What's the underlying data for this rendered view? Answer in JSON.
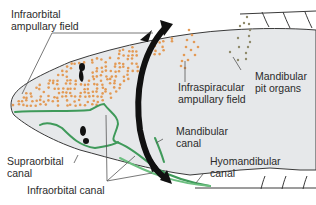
{
  "figure": {
    "colors": {
      "head_fill": "#e6e8ea",
      "outline": "#3a3a3a",
      "ampullae_dots": "#e39a55",
      "pit_organs": "#8f8a6a",
      "canal_green": "#3f9a5a",
      "arrow_black": "#111111",
      "leader_line": "#555555"
    }
  },
  "labels": {
    "infraorbital_ampullary_field": {
      "line1": "Infraorbital",
      "line2": "ampullary field"
    },
    "infraspiracular_ampullary_field": {
      "line1": "Infraspiracular",
      "line2": "ampullary field"
    },
    "mandibular_pit_organs": {
      "line1": "Mandibular",
      "line2": "pit organs"
    },
    "mandibular_canal": {
      "line1": "Mandibular",
      "line2": "canal"
    },
    "hyomandibular_canal": {
      "line1": "Hyomandibular",
      "line2": "canal"
    },
    "supraorbital_canal": {
      "line1": "Supraorbital",
      "line2": "canal"
    },
    "infraorbital_canal": {
      "line1": "Infraorbital canal"
    }
  }
}
